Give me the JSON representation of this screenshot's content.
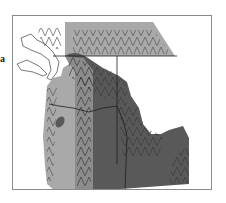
{
  "figure": {
    "panel_label": "a",
    "legend": []
  },
  "colors": {
    "background": "#ffffff",
    "frame": "#8a8a8a",
    "light_region": "#a9a9a9",
    "medium_region": "#8c8c8c",
    "dark_region": "#595959",
    "hatch": "#3a3a3a",
    "boundary": "#1e1e1e",
    "water_outline": "#555555"
  },
  "regions": [
    {
      "name": "coastal-light-zone",
      "shade": "light"
    },
    {
      "name": "northern-light-band",
      "shade": "light"
    },
    {
      "name": "cascade-medium-band",
      "shade": "medium"
    },
    {
      "name": "interior-dark-zone",
      "shade": "dark"
    },
    {
      "name": "oregon-dark-patch",
      "shade": "dark"
    }
  ],
  "boundaries": [
    {
      "name": "canada-us-border"
    },
    {
      "name": "washington-oregon-border"
    },
    {
      "name": "washington-idaho-border"
    },
    {
      "name": "oregon-idaho-border"
    }
  ]
}
